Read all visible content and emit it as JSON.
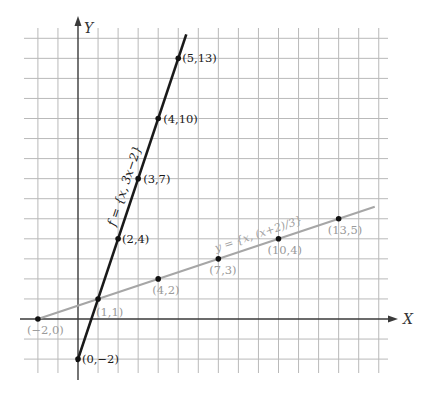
{
  "chart_data": {
    "type": "line",
    "title": "",
    "xlabel": "X",
    "ylabel": "Y",
    "xlim": [
      -2,
      15
    ],
    "ylim": [
      -2,
      14
    ],
    "grid": true,
    "series": [
      {
        "name": "f = {x, 3x-2}",
        "label": "f = {x, 3x−2}",
        "color": "#1a1a1a",
        "style": "dark",
        "line_x_range": [
          -0.05,
          5.4
        ],
        "points": [
          {
            "x": 0,
            "y": -2,
            "label": "(0,−2)"
          },
          {
            "x": 2,
            "y": 4,
            "label": "(2,4)"
          },
          {
            "x": 3,
            "y": 7,
            "label": "(3,7)"
          },
          {
            "x": 4,
            "y": 10,
            "label": "(4,10)"
          },
          {
            "x": 5,
            "y": 13,
            "label": "(5,13)"
          }
        ]
      },
      {
        "name": "y = {x, (x+2)/3}",
        "label": "y = {x, (x+2)/3}",
        "color": "#a6a6a6",
        "style": "grey",
        "line_x_range": [
          -2,
          14.8
        ],
        "points": [
          {
            "x": -2,
            "y": 0,
            "label": "(−2,0)"
          },
          {
            "x": 1,
            "y": 1,
            "label": "(1,1)"
          },
          {
            "x": 4,
            "y": 2,
            "label": "(4,2)"
          },
          {
            "x": 7,
            "y": 3,
            "label": "(7,3)"
          },
          {
            "x": 10,
            "y": 4,
            "label": "(10,4)"
          },
          {
            "x": 13,
            "y": 5,
            "label": "(13,5)"
          }
        ]
      }
    ]
  }
}
